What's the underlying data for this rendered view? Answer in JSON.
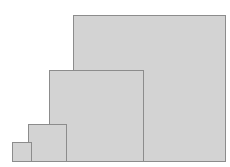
{
  "diagram": {
    "fill_color": "#d3d3d3",
    "border_color": "#8c8c8c",
    "squares": [
      {
        "name": "large",
        "x": 73,
        "y": 15,
        "w": 153,
        "h": 147
      },
      {
        "name": "medium",
        "x": 49,
        "y": 70,
        "w": 95,
        "h": 92
      },
      {
        "name": "small",
        "x": 28,
        "y": 124,
        "w": 39,
        "h": 38
      },
      {
        "name": "tiny",
        "x": 12,
        "y": 142,
        "w": 20,
        "h": 20
      }
    ]
  }
}
